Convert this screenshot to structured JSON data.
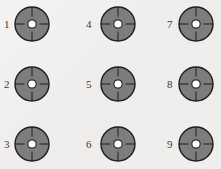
{
  "diagram": {
    "title": "",
    "colors": {
      "background": "#f1f0ee",
      "disk_fill": "#7d7d7d",
      "disk_stroke": "#1e1e1e",
      "center_fill": "#ffffff",
      "tick": "#1e1e1e",
      "label": "#3a3a3a"
    },
    "targets": [
      {
        "id": 1,
        "label": "1",
        "icon": "target-icon",
        "cx": 32,
        "cy": 24,
        "label_x": 4,
        "label_y": 19
      },
      {
        "id": 2,
        "label": "2",
        "icon": "target-icon",
        "cx": 32,
        "cy": 84,
        "label_x": 4,
        "label_y": 79
      },
      {
        "id": 3,
        "label": "3",
        "icon": "target-icon",
        "cx": 32,
        "cy": 144,
        "label_x": 4,
        "label_y": 139
      },
      {
        "id": 4,
        "label": "4",
        "icon": "target-icon",
        "cx": 118,
        "cy": 24,
        "label_x": 86,
        "label_y": 19
      },
      {
        "id": 5,
        "label": "5",
        "icon": "target-icon",
        "cx": 118,
        "cy": 84,
        "label_x": 86,
        "label_y": 79
      },
      {
        "id": 6,
        "label": "6",
        "icon": "target-icon",
        "cx": 118,
        "cy": 144,
        "label_x": 86,
        "label_y": 139
      },
      {
        "id": 7,
        "label": "7",
        "icon": "target-icon",
        "cx": 196,
        "cy": 24,
        "label_x": 167,
        "label_y": 19
      },
      {
        "id": 8,
        "label": "8",
        "icon": "target-icon",
        "cx": 196,
        "cy": 84,
        "label_x": 167,
        "label_y": 79
      },
      {
        "id": 9,
        "label": "9",
        "icon": "target-icon",
        "cx": 196,
        "cy": 144,
        "label_x": 167,
        "label_y": 139
      }
    ],
    "geometry": {
      "radius": 17,
      "center_radius": 4.2,
      "center_ring_width": 2,
      "tick_inner": 7.5,
      "tick_outer": 17
    }
  }
}
